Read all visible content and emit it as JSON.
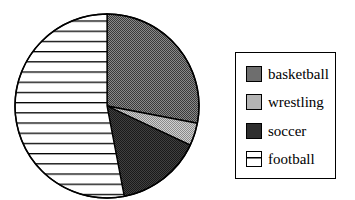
{
  "chart_data": {
    "type": "pie",
    "title": "",
    "categories": [
      "basketball",
      "wrestling",
      "soccer",
      "football"
    ],
    "values": [
      28,
      4,
      15,
      53
    ],
    "unit": "percent (estimated from slice angles)",
    "start_angle": "12 o'clock, clockwise",
    "legend_position": "right",
    "fills": {
      "basketball": {
        "color": "#6e6e6e",
        "pattern": "dense-dither"
      },
      "wrestling": {
        "color": "#b4b4b4",
        "pattern": "light-dither"
      },
      "soccer": {
        "color": "#2e2e2e",
        "pattern": "dark-dither"
      },
      "football": {
        "color": "#ffffff",
        "pattern": "horizontal-lines"
      }
    }
  },
  "legend": {
    "items": [
      {
        "label": "basketball"
      },
      {
        "label": "wrestling"
      },
      {
        "label": "soccer"
      },
      {
        "label": "football"
      }
    ]
  }
}
